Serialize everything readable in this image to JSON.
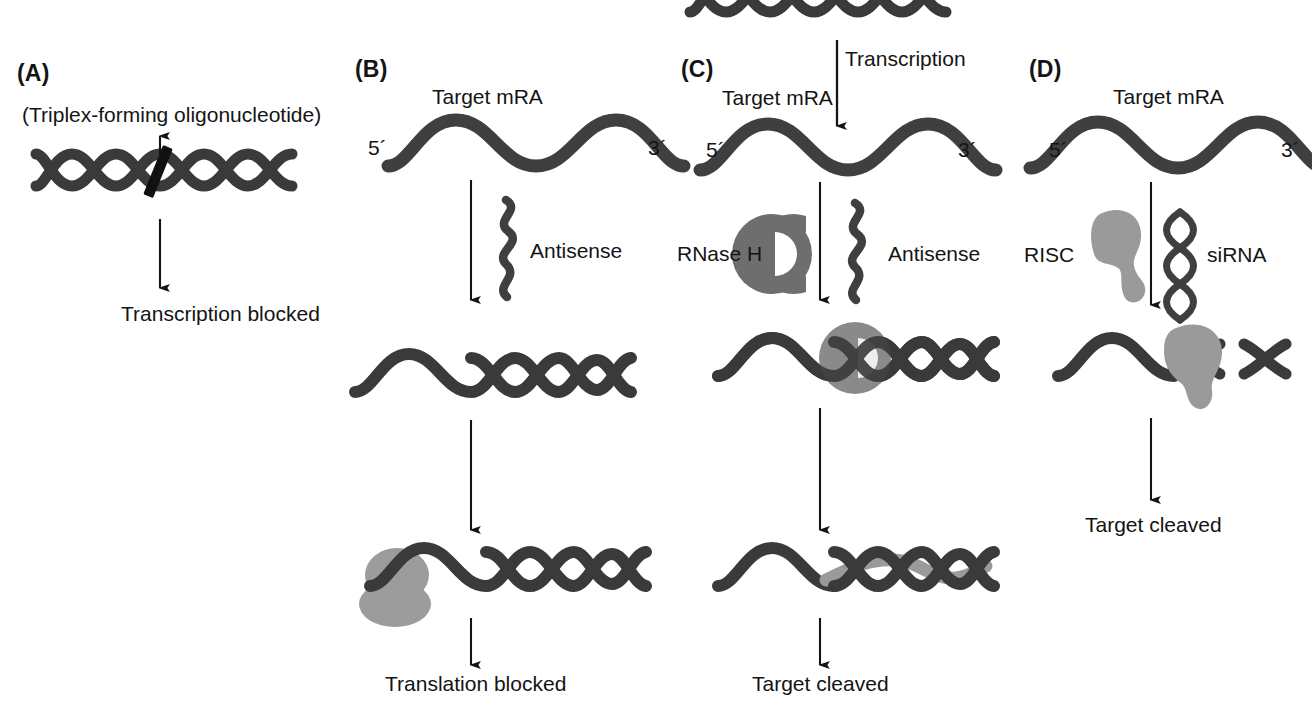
{
  "figure": {
    "kind": "scientific-diagram",
    "colors": {
      "strand_dark": "#3a3a3a",
      "strand_dark_alt": "#444444",
      "protein_mid_gray": "#6e6e6e",
      "protein_light_gray": "#9a9a9a",
      "ribosome_gray": "#9c9c9c",
      "text": "#141414",
      "background": "#ffffff"
    },
    "panels": [
      {
        "id": "A",
        "label": "(A)",
        "captions": {
          "top": "(Triplex-forming oligonucleotide)",
          "bottom": "Transcription blocked"
        },
        "elements": [
          "dna-double-helix",
          "triplex-oligo-bar",
          "up-arrow",
          "down-arrow"
        ]
      },
      {
        "id": "B",
        "label": "(B)",
        "captions": {
          "target": "Target mRA",
          "five_prime": "5´",
          "three_prime": "3´",
          "agent": "Antisense",
          "bottom": "Translation blocked"
        },
        "elements": [
          "target-mrna-strand",
          "antisense-strand",
          "duplex-helix",
          "ribosome-blob",
          "down-arrow"
        ]
      },
      {
        "id": "C",
        "label": "(C)",
        "captions": {
          "transcription": "Transcription",
          "target": "Target mRA",
          "five_prime": "5´",
          "three_prime": "3´",
          "enzyme": "RNase H",
          "agent": "Antisense",
          "bottom": "Target cleaved"
        },
        "elements": [
          "dna-double-helix-top",
          "target-mrna-strand",
          "antisense-strand",
          "rnase-h-enzyme",
          "duplex-helix",
          "cleaved-duplex",
          "down-arrow"
        ]
      },
      {
        "id": "D",
        "label": "(D)",
        "captions": {
          "target": "Target mRA",
          "five_prime": "5´",
          "three_prime": "3´",
          "complex": "RISC",
          "agent": "siRNA",
          "bottom": "Target cleaved"
        },
        "elements": [
          "target-mrna-strand",
          "risc-blob",
          "sirna-duplex",
          "risc-loaded-strand",
          "down-arrow"
        ]
      }
    ]
  }
}
